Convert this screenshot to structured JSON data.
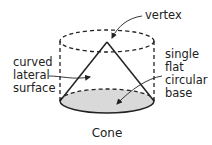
{
  "diagram": {
    "title": "Cone",
    "labels": {
      "vertex": "vertex",
      "lateral": [
        "curved",
        "lateral",
        "surface"
      ],
      "base": [
        "single",
        "flat",
        "circular",
        "base"
      ]
    },
    "colors": {
      "stroke": "#222222",
      "base_fill": "#d9d9d9",
      "background": "#ffffff"
    }
  }
}
